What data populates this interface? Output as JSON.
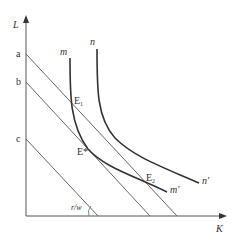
{
  "diagram": {
    "type": "isoquant-isocost",
    "axes": {
      "y_label": "L",
      "x_label": "K"
    },
    "intercepts": {
      "a": "a",
      "b": "b",
      "c": "c"
    },
    "curves": {
      "m_start": "m",
      "m_end": "m'",
      "n_start": "n",
      "n_end": "n'"
    },
    "points": {
      "e1": "E",
      "e1_sub": "1",
      "e2": "E",
      "e2_sub": "2",
      "estar": "E*"
    },
    "angle_label": "r/w",
    "colors": {
      "axis": "#555555",
      "isocost": "#666666",
      "isoquant": "#333333",
      "text": "#333333"
    }
  }
}
